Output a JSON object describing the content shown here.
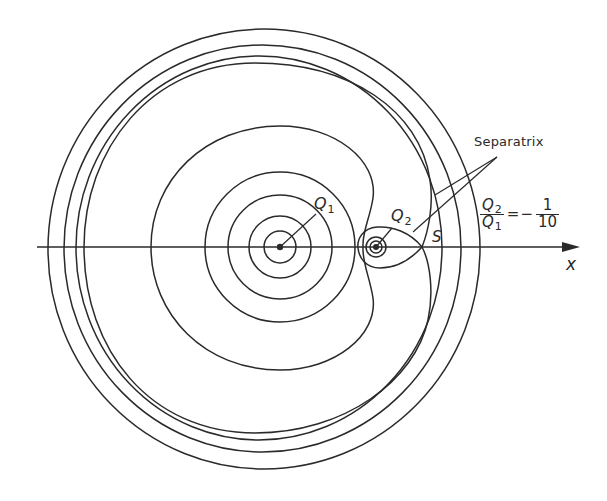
{
  "figure": {
    "type": "field-line-diagram",
    "colors": {
      "ink": "#2a2a2a",
      "background": "#ffffff"
    },
    "axis": {
      "label": "x",
      "y": 247,
      "x_start": 37,
      "x_end": 580
    },
    "charges": [
      {
        "name": "Q1",
        "label": "Q",
        "subscript": "1",
        "cx": 280,
        "cy": 247
      },
      {
        "name": "Q2",
        "label": "Q",
        "subscript": "2",
        "cx": 376,
        "cy": 247
      }
    ],
    "saddle_point": {
      "label": "S",
      "x": 422,
      "y": 247
    },
    "separatrix_label": "Separatrix",
    "ratio": {
      "numerator": "Q",
      "numerator_sub": "2",
      "denominator": "Q",
      "denominator_sub": "1",
      "equals": "=",
      "sign": "−",
      "value_numerator": "1",
      "value_denominator": "10"
    }
  }
}
